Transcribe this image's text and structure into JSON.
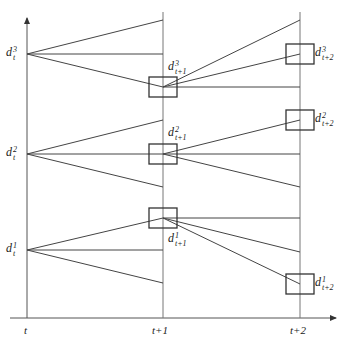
{
  "diagram": {
    "colors": {
      "line": "#444444",
      "axis": "#666666",
      "box": "#333333",
      "text": "#222222"
    },
    "x_axis": {
      "ticks": [
        {
          "label": "t",
          "x": 27
        },
        {
          "label": "t+1",
          "x": 163
        },
        {
          "label": "t+2",
          "x": 300
        }
      ]
    },
    "nodes_t": [
      {
        "base": "d",
        "sup": "3",
        "sub": "t",
        "y": 54
      },
      {
        "base": "d",
        "sup": "2",
        "sub": "t",
        "y": 154
      },
      {
        "base": "d",
        "sup": "1",
        "sub": "t",
        "y": 250
      }
    ],
    "nodes_t1": [
      {
        "base": "d",
        "sup": "3",
        "sub": "t+1",
        "y": 87
      },
      {
        "base": "d",
        "sup": "2",
        "sub": "t+1",
        "y": 154
      },
      {
        "base": "d",
        "sup": "1",
        "sub": "t+1",
        "y": 218
      }
    ],
    "nodes_t2": [
      {
        "base": "d",
        "sup": "3",
        "sub": "t+2",
        "y": 54
      },
      {
        "base": "d",
        "sup": "2",
        "sub": "t+2",
        "y": 120
      },
      {
        "base": "d",
        "sup": "1",
        "sub": "t+2",
        "y": 284
      }
    ],
    "fan_t_to_t1": [
      {
        "from": 54,
        "to": [
          20,
          54,
          87
        ]
      },
      {
        "from": 154,
        "to": [
          120,
          154,
          187
        ]
      },
      {
        "from": 250,
        "to": [
          218,
          250,
          283
        ]
      }
    ],
    "fan_t1_to_t2": [
      {
        "from": 87,
        "to": [
          20,
          54,
          87
        ]
      },
      {
        "from": 154,
        "to": [
          120,
          154,
          187
        ]
      },
      {
        "from": 218,
        "to": [
          218,
          252,
          284
        ]
      }
    ]
  }
}
